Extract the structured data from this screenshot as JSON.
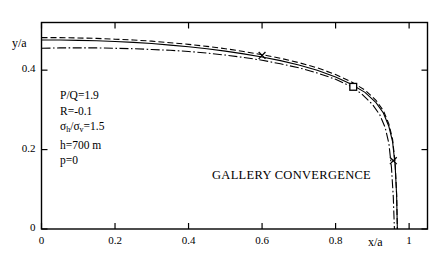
{
  "chart_data": {
    "type": "line",
    "title": "",
    "xlabel": "x/a",
    "ylabel": "y/a",
    "xlim": [
      0,
      1.05
    ],
    "ylim": [
      0,
      0.52
    ],
    "xticks": [
      "0",
      "0.2",
      "0.4",
      "0.6",
      "0.8",
      "1"
    ],
    "xtick_values": [
      0,
      0.2,
      0.4,
      0.6,
      0.8,
      1
    ],
    "yticks": [
      "0",
      "0.2",
      "0.4"
    ],
    "ytick_values": [
      0,
      0.2,
      0.4
    ],
    "grid": false,
    "legend": "none",
    "frame": "box-all-sides-ticks-inward",
    "annotation": "GALLERY CONVERGENCE",
    "parameters": [
      "P/Q=1.9",
      "R=-0.1",
      "σh/σv=1.5",
      "h=700 m",
      "p=0"
    ],
    "series": [
      {
        "name": "curve-solid",
        "style": "solid",
        "x": [
          0.0,
          0.05,
          0.1,
          0.15,
          0.2,
          0.25,
          0.3,
          0.35,
          0.4,
          0.45,
          0.5,
          0.55,
          0.6,
          0.65,
          0.7,
          0.75,
          0.8,
          0.84,
          0.88,
          0.91,
          0.93,
          0.945,
          0.955,
          0.962,
          0.966,
          0.968
        ],
        "y": [
          0.476,
          0.476,
          0.475,
          0.474,
          0.472,
          0.47,
          0.467,
          0.463,
          0.459,
          0.454,
          0.448,
          0.441,
          0.433,
          0.424,
          0.413,
          0.4,
          0.383,
          0.366,
          0.344,
          0.318,
          0.292,
          0.258,
          0.22,
          0.16,
          0.085,
          0.0
        ]
      },
      {
        "name": "curve-dashed",
        "style": "dashed",
        "x": [
          0.0,
          0.05,
          0.1,
          0.15,
          0.2,
          0.25,
          0.3,
          0.35,
          0.4,
          0.45,
          0.5,
          0.55,
          0.6,
          0.65,
          0.7,
          0.75,
          0.8,
          0.84,
          0.88,
          0.91,
          0.93,
          0.945,
          0.955,
          0.962,
          0.966,
          0.968
        ],
        "y": [
          0.482,
          0.482,
          0.481,
          0.48,
          0.478,
          0.476,
          0.473,
          0.469,
          0.465,
          0.46,
          0.454,
          0.447,
          0.439,
          0.43,
          0.419,
          0.406,
          0.389,
          0.372,
          0.35,
          0.324,
          0.298,
          0.264,
          0.226,
          0.165,
          0.088,
          0.0
        ]
      },
      {
        "name": "curve-dash-dot",
        "style": "dash-dot",
        "x": [
          0.0,
          0.05,
          0.1,
          0.15,
          0.2,
          0.25,
          0.3,
          0.35,
          0.4,
          0.45,
          0.5,
          0.55,
          0.6,
          0.65,
          0.7,
          0.75,
          0.8,
          0.84,
          0.87,
          0.9,
          0.92,
          0.935,
          0.945,
          0.952,
          0.957,
          0.96
        ],
        "y": [
          0.455,
          0.456,
          0.456,
          0.456,
          0.455,
          0.454,
          0.452,
          0.45,
          0.447,
          0.443,
          0.438,
          0.432,
          0.425,
          0.416,
          0.406,
          0.393,
          0.377,
          0.36,
          0.341,
          0.314,
          0.288,
          0.255,
          0.215,
          0.155,
          0.08,
          0.0
        ]
      }
    ],
    "markers": [
      {
        "name": "marker-cross-1",
        "symbol": "x",
        "x": 0.6,
        "y": 0.437
      },
      {
        "name": "marker-square-1",
        "symbol": "square",
        "x": 0.848,
        "y": 0.358
      },
      {
        "name": "marker-cross-2",
        "symbol": "x",
        "x": 0.957,
        "y": 0.172
      }
    ]
  }
}
